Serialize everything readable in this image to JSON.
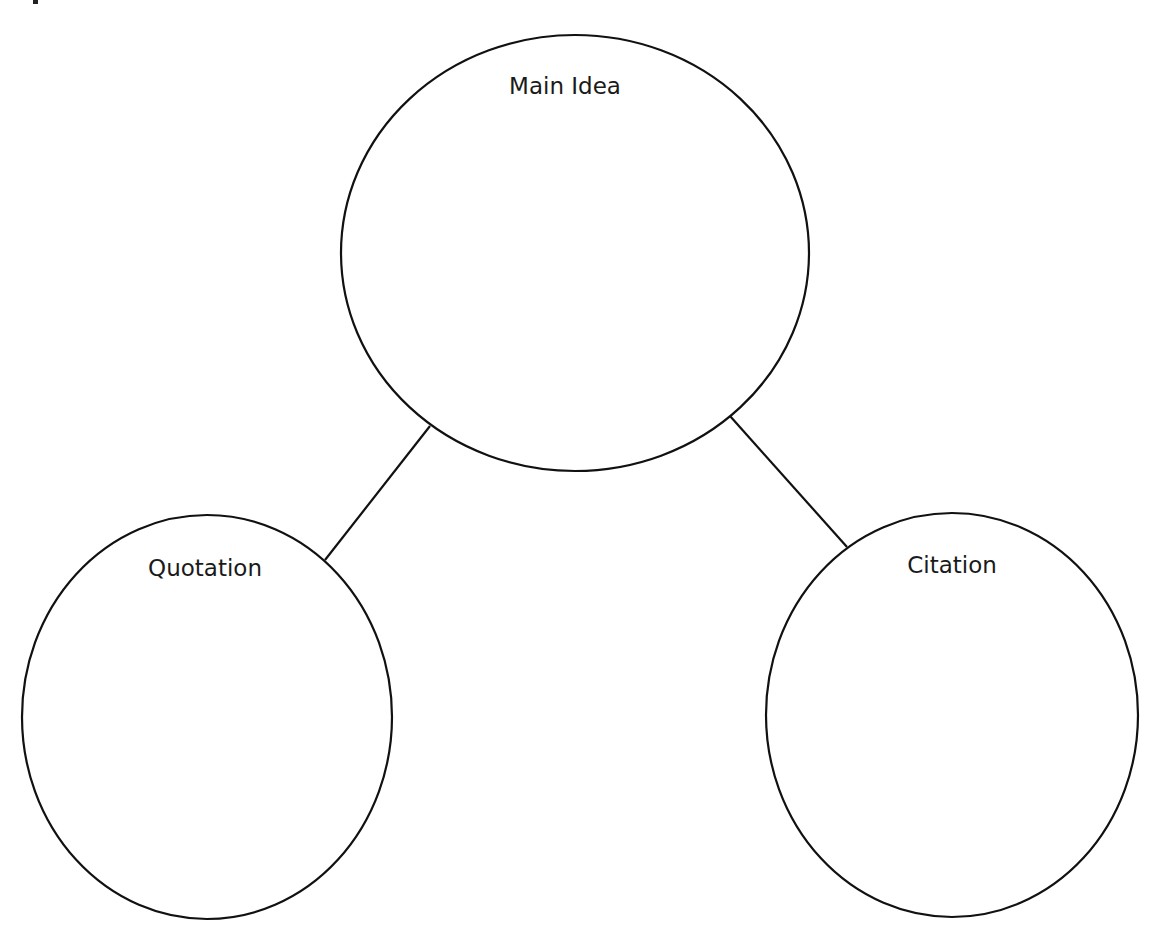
{
  "diagram": {
    "type": "bubble-map",
    "colors": {
      "stroke": "#111111",
      "text": "#1a1a1a",
      "background": "#ffffff"
    },
    "nodes": [
      {
        "id": "main",
        "label": "Main Idea",
        "cx": 575,
        "cy": 253,
        "rx": 234,
        "ry": 218,
        "label_x": 565,
        "label_y": 94
      },
      {
        "id": "quotation",
        "label": "Quotation",
        "cx": 207,
        "cy": 717,
        "rx": 185,
        "ry": 202,
        "label_x": 205,
        "label_y": 576
      },
      {
        "id": "citation",
        "label": "Citation",
        "cx": 952,
        "cy": 715,
        "rx": 186,
        "ry": 202,
        "label_x": 952,
        "label_y": 573
      }
    ],
    "edges": [
      {
        "from": "main",
        "to": "quotation",
        "x1": 430,
        "y1": 426,
        "x2": 325,
        "y2": 560
      },
      {
        "from": "main",
        "to": "citation",
        "x1": 730,
        "y1": 416,
        "x2": 847,
        "y2": 547
      }
    ]
  }
}
